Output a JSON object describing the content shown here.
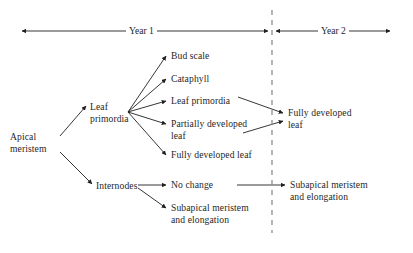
{
  "figure": {
    "kind": "flow-diagram",
    "background_color": "#ffffff",
    "ink_color": "#1f1f1f",
    "divider_color": "#8c8c8c"
  },
  "timeline": {
    "year1_label": "Year 1",
    "year2_label": "Year 2"
  },
  "nodes": {
    "apical_meristem": "Apical\nmeristem",
    "leaf_primordia_source": "Leaf\nprimordia",
    "internodes": "Internodes",
    "bud_scale": "Bud scale",
    "cataphyll": "Cataphyll",
    "leaf_primordia_fate": "Leaf primordia",
    "partially_developed_leaf": "Partially developed\nleaf",
    "fully_developed_leaf_y1": "Fully developed leaf",
    "no_change": "No change",
    "subapical_meristem_y1": "Subapical meristem\nand elongation",
    "fully_developed_leaf_y2": "Fully developed\nleaf",
    "subapical_meristem_y2": "Subapical meristem\nand elongation"
  }
}
